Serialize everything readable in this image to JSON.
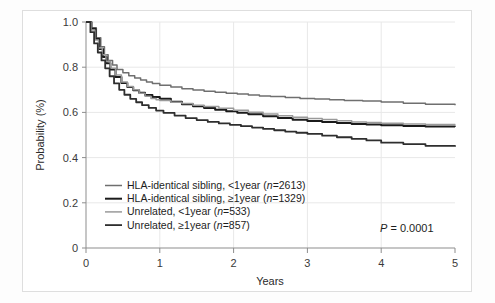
{
  "figure": {
    "background_color": "#ffffff",
    "frame_color": "#dedede"
  },
  "chart_data": {
    "type": "line",
    "title": "",
    "subtitle": "",
    "xlabel": "Years",
    "ylabel": "Probability (%)",
    "xlim": [
      0,
      5
    ],
    "ylim": [
      0,
      1.0
    ],
    "xticks": [
      "0",
      "1",
      "2",
      "3",
      "4",
      "5"
    ],
    "xtick_values": [
      0,
      1,
      2,
      3,
      4,
      5
    ],
    "yticks": [
      "0",
      "0.2",
      "0.4",
      "0.6",
      "0.8",
      "1.0"
    ],
    "ytick_values": [
      0,
      0.2,
      0.4,
      0.6,
      0.8,
      1.0
    ],
    "grid": true,
    "grid_color": "#e8e8e8",
    "legend_position": "lower-left-inside",
    "annotations": [
      {
        "name": "p-value",
        "text_italic": "P",
        "text_rest": " = 0.0001",
        "x": 4.15,
        "y": 0.115
      }
    ],
    "series": [
      {
        "name": "HLA-identical sibling, <1year",
        "n": 2613,
        "label": "HLA-identical sibling, <1year (n=2613)",
        "label_prefix": "HLA-identical sibling, <1year (",
        "label_italic": "n",
        "label_suffix": "=2613)",
        "color": "#6f6f6f",
        "width": 1.5,
        "x": [
          0,
          0.08,
          0.14,
          0.2,
          0.25,
          0.3,
          0.36,
          0.42,
          0.5,
          0.58,
          0.66,
          0.74,
          0.82,
          0.9,
          1.0,
          1.15,
          1.3,
          1.45,
          1.6,
          1.75,
          1.9,
          2.05,
          2.2,
          2.35,
          2.5,
          2.7,
          2.9,
          3.1,
          3.3,
          3.5,
          3.75,
          4.0,
          4.3,
          4.6,
          5.0
        ],
        "y": [
          1.0,
          0.975,
          0.93,
          0.89,
          0.855,
          0.83,
          0.81,
          0.79,
          0.775,
          0.762,
          0.752,
          0.743,
          0.735,
          0.728,
          0.72,
          0.712,
          0.705,
          0.699,
          0.694,
          0.689,
          0.685,
          0.681,
          0.677,
          0.673,
          0.67,
          0.666,
          0.662,
          0.659,
          0.656,
          0.653,
          0.65,
          0.646,
          0.64,
          0.636,
          0.632
        ]
      },
      {
        "name": "HLA-identical sibling, ≥1year",
        "n": 1329,
        "label": "HLA-identical sibling, ≥1year (n=1329)",
        "label_prefix": "HLA-identical sibling, ≥1year (",
        "label_italic": "n",
        "label_suffix": "=1329)",
        "color": "#1b1b1b",
        "width": 2.0,
        "x": [
          0,
          0.07,
          0.13,
          0.18,
          0.23,
          0.28,
          0.33,
          0.4,
          0.48,
          0.56,
          0.64,
          0.72,
          0.8,
          0.9,
          1.0,
          1.15,
          1.3,
          1.45,
          1.6,
          1.75,
          1.9,
          2.05,
          2.2,
          2.4,
          2.6,
          2.8,
          3.0,
          3.2,
          3.4,
          3.6,
          3.8,
          4.0,
          4.3,
          4.6,
          5.0
        ],
        "y": [
          1.0,
          0.97,
          0.925,
          0.88,
          0.845,
          0.818,
          0.79,
          0.757,
          0.73,
          0.712,
          0.698,
          0.687,
          0.677,
          0.668,
          0.66,
          0.647,
          0.636,
          0.627,
          0.619,
          0.612,
          0.605,
          0.598,
          0.592,
          0.583,
          0.575,
          0.568,
          0.562,
          0.557,
          0.553,
          0.549,
          0.546,
          0.543,
          0.54,
          0.538,
          0.537
        ]
      },
      {
        "name": "Unrelated, <1year",
        "n": 533,
        "label": "Unrelated, <1year (n=533)",
        "label_prefix": "Unrelated, <1year (",
        "label_italic": "n",
        "label_suffix": "=533)",
        "color": "#9a9a9a",
        "width": 1.5,
        "x": [
          0,
          0.07,
          0.12,
          0.17,
          0.22,
          0.27,
          0.33,
          0.4,
          0.48,
          0.56,
          0.64,
          0.72,
          0.8,
          0.88,
          0.95,
          1.0,
          1.15,
          1.3,
          1.45,
          1.6,
          1.8,
          2.0,
          2.2,
          2.4,
          2.6,
          2.8,
          3.0,
          3.2,
          3.4,
          3.6,
          3.8,
          4.0,
          4.3,
          4.6,
          5.0
        ],
        "y": [
          1.0,
          0.965,
          0.92,
          0.885,
          0.855,
          0.825,
          0.795,
          0.765,
          0.735,
          0.715,
          0.7,
          0.685,
          0.672,
          0.662,
          0.656,
          0.653,
          0.645,
          0.639,
          0.632,
          0.626,
          0.618,
          0.61,
          0.601,
          0.593,
          0.585,
          0.578,
          0.573,
          0.569,
          0.563,
          0.558,
          0.555,
          0.552,
          0.549,
          0.546,
          0.545
        ]
      },
      {
        "name": "Unrelated, ≥1year",
        "n": 857,
        "label": "Unrelated, ≥1year (n=857)",
        "label_prefix": "Unrelated, ≥1year (",
        "label_italic": "n",
        "label_suffix": "=857)",
        "color": "#2e2e2e",
        "width": 1.8,
        "x": [
          0,
          0.06,
          0.11,
          0.16,
          0.21,
          0.26,
          0.32,
          0.38,
          0.45,
          0.52,
          0.6,
          0.68,
          0.76,
          0.85,
          0.95,
          1.05,
          1.2,
          1.35,
          1.5,
          1.65,
          1.8,
          1.95,
          2.1,
          2.25,
          2.4,
          2.55,
          2.7,
          2.85,
          3.0,
          3.2,
          3.4,
          3.6,
          3.8,
          4.0,
          4.3,
          4.6,
          5.0
        ],
        "y": [
          1.0,
          0.955,
          0.905,
          0.865,
          0.83,
          0.795,
          0.76,
          0.728,
          0.7,
          0.678,
          0.66,
          0.645,
          0.632,
          0.62,
          0.608,
          0.598,
          0.586,
          0.575,
          0.566,
          0.558,
          0.551,
          0.545,
          0.539,
          0.533,
          0.527,
          0.521,
          0.515,
          0.51,
          0.505,
          0.497,
          0.49,
          0.483,
          0.476,
          0.466,
          0.46,
          0.452,
          0.448
        ]
      }
    ]
  }
}
